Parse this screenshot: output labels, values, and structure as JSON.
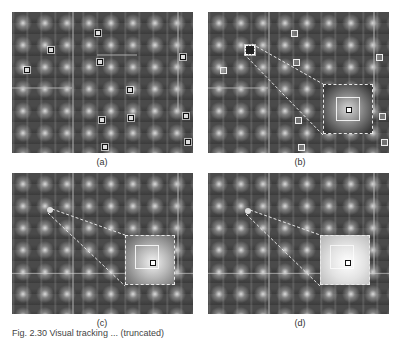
{
  "figure": {
    "panels": [
      {
        "id": "a",
        "label": "(a)",
        "description": "Grayscale feature response map with small square keypoint markers"
      },
      {
        "id": "b",
        "label": "(b)",
        "description": "Same map with one keypoint highlighted and magnified inset (dark gradient window)"
      },
      {
        "id": "c",
        "label": "(c)",
        "description": "Magnified inset with medium brightness gradient window"
      },
      {
        "id": "d",
        "label": "(d)",
        "description": "Magnified inset with bright gradient window"
      }
    ],
    "caption": "Fig. 2.30 Visual tracking ... (truncated)"
  }
}
